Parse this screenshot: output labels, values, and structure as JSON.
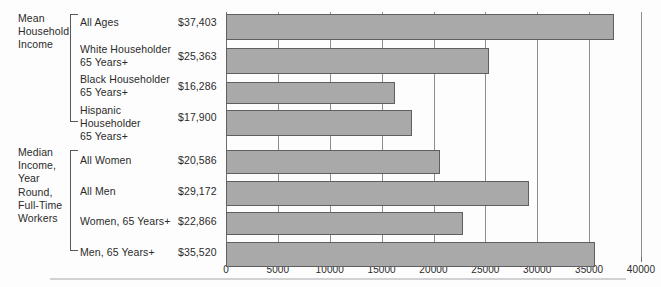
{
  "groups": [
    {
      "name": "mean-household-income",
      "title": "Mean\nHousehold\nIncome",
      "rows": [
        {
          "label": "All Ages",
          "value_text": "$37,403",
          "value": 37403
        },
        {
          "label": "White Householder\n65 Years+",
          "value_text": "$25,363",
          "value": 25363
        },
        {
          "label": "Black Householder\n65 Years+",
          "value_text": "$16,286",
          "value": 16286
        },
        {
          "label": "Hispanic Householder\n65 Years+",
          "value_text": "$17,900",
          "value": 17900
        }
      ]
    },
    {
      "name": "median-income-year-round-full-time-workers",
      "title": "Median\nIncome,\nYear\nRound,\nFull-Time\nWorkers",
      "rows": [
        {
          "label": "All Women",
          "value_text": "$20,586",
          "value": 20586
        },
        {
          "label": "All Men",
          "value_text": "$29,172",
          "value": 29172
        },
        {
          "label": "Women, 65 Years+",
          "value_text": "$22,866",
          "value": 22866
        },
        {
          "label": "Men, 65 Years+",
          "value_text": "$35,520",
          "value": 35520
        }
      ]
    }
  ],
  "axis": {
    "ticks": [
      "0",
      "5000",
      "10000",
      "15000",
      "20000",
      "25000",
      "30000",
      "35000",
      "40000"
    ],
    "min": 0,
    "max": 40000,
    "step": 5000
  },
  "colors": {
    "bar_fill": "#a9a9a9",
    "bar_stroke": "#5f5f61",
    "gridline": "#8d8d8f",
    "axis": "#6e6e70",
    "text": "#2b2b2b",
    "background": "#fdfdfd",
    "rule": "#d2d2d4"
  },
  "chart_data": {
    "type": "bar",
    "orientation": "horizontal",
    "title": "",
    "subtitle": "",
    "xlabel": "",
    "ylabel": "",
    "xlim": [
      0,
      40000
    ],
    "grid": true,
    "legend": "none",
    "tick_labels": [
      "0",
      "5000",
      "10000",
      "15000",
      "20000",
      "25000",
      "30000",
      "35000",
      "40000"
    ],
    "group_labels": [
      "Mean Household Income",
      "Median Income, Year Round, Full-Time Workers"
    ],
    "categories": [
      "All Ages",
      "White Householder 65 Years+",
      "Black Householder 65 Years+",
      "Hispanic Householder 65 Years+",
      "All Women",
      "All Men",
      "Women, 65 Years+",
      "Men, 65 Years+"
    ],
    "values": [
      37403,
      25363,
      16286,
      17900,
      20586,
      29172,
      22866,
      35520
    ],
    "data_labels": [
      "$37,403",
      "$25,363",
      "$16,286",
      "$17,900",
      "$20,586",
      "$29,172",
      "$22,866",
      "$35,520"
    ]
  },
  "layout": {
    "rows": [
      {
        "bar_top": 14,
        "bar_height": 26,
        "label_top": 16,
        "value_top": 16
      },
      {
        "bar_top": 48,
        "bar_height": 26,
        "label_top": 43,
        "value_top": 50
      },
      {
        "bar_top": 82,
        "bar_height": 22,
        "label_top": 73,
        "value_top": 80
      },
      {
        "bar_top": 110,
        "bar_height": 26,
        "label_top": 104,
        "value_top": 111
      },
      {
        "bar_top": 150,
        "bar_height": 24,
        "label_top": 154,
        "value_top": 154
      },
      {
        "bar_top": 181,
        "bar_height": 25,
        "label_top": 185,
        "value_top": 185
      },
      {
        "bar_top": 212,
        "bar_height": 23,
        "label_top": 215,
        "value_top": 215
      },
      {
        "bar_top": 242,
        "bar_height": 25,
        "label_top": 246,
        "value_top": 246
      }
    ]
  }
}
